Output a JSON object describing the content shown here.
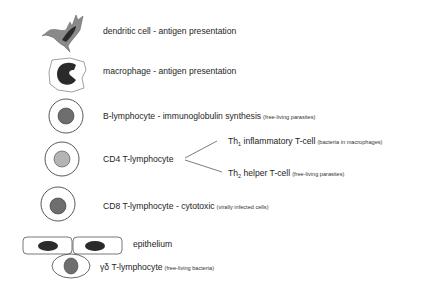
{
  "cells": [
    {
      "name": "dendritic cell",
      "label": "dendritic cell - antigen presentation",
      "note": ""
    },
    {
      "name": "macrophage",
      "label": "macrophage - antigen presentation",
      "note": ""
    },
    {
      "name": "B-lymphocyte",
      "label": "B-lymphocyte - immunoglobulin synthesis",
      "note": "(free-living parasites)"
    },
    {
      "name": "CD4 T-lymphocyte",
      "label": "CD4 T-lymphocyte",
      "note": ""
    },
    {
      "name": "CD8 T-lymphocyte",
      "label": "CD8 T-lymphocyte - cytotoxic",
      "note": "(virally infected cells)"
    },
    {
      "name": "epithelium",
      "label": "epithelium",
      "note": ""
    },
    {
      "name": "gamma-delta T-lymphocyte",
      "label": "γδ T-lymphocyte",
      "note": "(free-living bacteria)"
    }
  ],
  "cd4_branches": [
    {
      "prefix": "Th",
      "subscript": "1",
      "label": " inflammatory T-cell",
      "note": "(bacteria in macrophages)"
    },
    {
      "prefix": "Th",
      "subscript": "2",
      "label": " helper T-cell",
      "note": "(free-living parasites)"
    }
  ],
  "colors": {
    "nucleus_dark": "#2a2a2a",
    "nucleus_mid": "#6e6e6e",
    "nucleus_light": "#b4b4b4",
    "outline": "#555555",
    "dendritic_body": "#8a8a8a"
  }
}
